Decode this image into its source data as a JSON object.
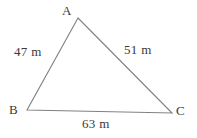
{
  "figure": {
    "type": "triangle-diagram",
    "background_color": "#ffffff",
    "stroke_color": "#808080",
    "text_color": "#3a3a3a",
    "width": 197,
    "height": 138,
    "unit": "m",
    "vertices": [
      {
        "name": "A",
        "label": "A",
        "x": 78,
        "y": 18
      },
      {
        "name": "B",
        "label": "B",
        "x": 27,
        "y": 110
      },
      {
        "name": "C",
        "label": "C",
        "x": 172,
        "y": 113
      }
    ],
    "sides": [
      {
        "name": "AB",
        "label": "47 m",
        "value": 47
      },
      {
        "name": "AC",
        "label": "51 m",
        "value": 51
      },
      {
        "name": "BC",
        "label": "63 m",
        "value": 63
      }
    ]
  },
  "chart_data": {
    "type": "diagram",
    "title": "",
    "shape": "triangle",
    "categories": [
      "AB",
      "AC",
      "BC"
    ],
    "values": [
      47,
      51,
      63
    ],
    "labels": [
      "47 m",
      "51 m",
      "63 m"
    ],
    "vertex_labels": [
      "A",
      "B",
      "C"
    ],
    "units": "m"
  }
}
